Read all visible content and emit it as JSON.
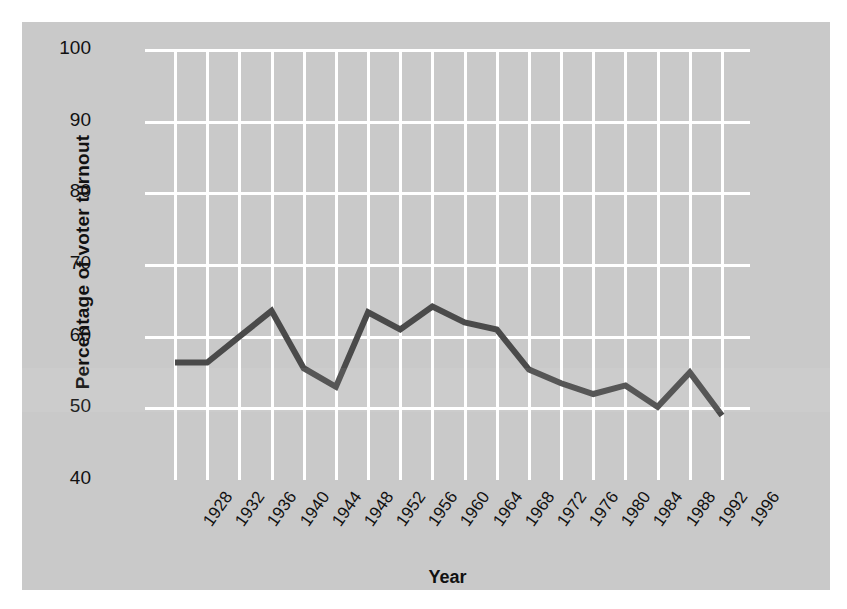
{
  "chart_data": {
    "type": "line",
    "title": "",
    "xlabel": "Year",
    "ylabel": "Percentage of voter turnout",
    "categories": [
      "1928",
      "1932",
      "1936",
      "1940",
      "1944",
      "1948",
      "1952",
      "1956",
      "1960",
      "1964",
      "1968",
      "1972",
      "1976",
      "1980",
      "1984",
      "1988",
      "1992",
      "1996"
    ],
    "x": [
      1928,
      1932,
      1936,
      1940,
      1944,
      1948,
      1952,
      1956,
      1960,
      1964,
      1968,
      1972,
      1976,
      1980,
      1984,
      1988,
      1992,
      1996
    ],
    "values": [
      56.4,
      56.4,
      60.0,
      63.6,
      55.6,
      53.0,
      63.4,
      61.0,
      64.2,
      62.0,
      61.0,
      55.4,
      53.5,
      52.0,
      53.2,
      50.2,
      55.0,
      49.0
    ],
    "series": [
      {
        "name": "Voter turnout",
        "values": [
          56.4,
          56.4,
          60.0,
          63.6,
          55.6,
          53.0,
          63.4,
          61.0,
          64.2,
          62.0,
          61.0,
          55.4,
          53.5,
          52.0,
          53.2,
          50.2,
          55.0,
          49.0
        ]
      }
    ],
    "ylim": [
      40,
      100
    ],
    "yticks": [
      40,
      50,
      60,
      70,
      80,
      90,
      100
    ],
    "ytick_labels": [
      "40",
      "50",
      "60",
      "70",
      "80",
      "90",
      "100"
    ],
    "xlim": [
      1928,
      1996
    ],
    "grid": true,
    "legend": null,
    "legend_position": "none",
    "line_color": "#4a4a4a",
    "grid_color": "#ffffff",
    "panel_color": "#c9c9c9",
    "text_color": "#111111",
    "xtick_rotation": -55
  }
}
